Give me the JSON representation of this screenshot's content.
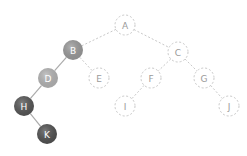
{
  "diagram": {
    "type": "binary-tree",
    "colors": {
      "background": "#ffffff",
      "dashed_stroke": "#c8c8c8",
      "dashed_label": "#9a9a9a",
      "solid_label": "#ffffff",
      "solid_edge": "#aaaaaa"
    },
    "nodes": [
      {
        "id": "A",
        "label": "A",
        "x": 125,
        "y": 25,
        "style": "dashed"
      },
      {
        "id": "B",
        "label": "B",
        "x": 73,
        "y": 50,
        "style": "filled",
        "fill": "#999999"
      },
      {
        "id": "C",
        "label": "C",
        "x": 178,
        "y": 52,
        "style": "dashed"
      },
      {
        "id": "D",
        "label": "D",
        "x": 48,
        "y": 78,
        "style": "filled",
        "fill": "#b3b3b3"
      },
      {
        "id": "E",
        "label": "E",
        "x": 99,
        "y": 78,
        "style": "dashed"
      },
      {
        "id": "F",
        "label": "F",
        "x": 151,
        "y": 78,
        "style": "dashed"
      },
      {
        "id": "G",
        "label": "G",
        "x": 204,
        "y": 78,
        "style": "dashed"
      },
      {
        "id": "H",
        "label": "H",
        "x": 24,
        "y": 106,
        "style": "filled",
        "fill": "#555555"
      },
      {
        "id": "I",
        "label": "I",
        "x": 125,
        "y": 106,
        "style": "dashed"
      },
      {
        "id": "J",
        "label": "J",
        "x": 229,
        "y": 106,
        "style": "dashed"
      },
      {
        "id": "K",
        "label": "K",
        "x": 47,
        "y": 134,
        "style": "filled",
        "fill": "#505050"
      }
    ],
    "edges": [
      {
        "from": "A",
        "to": "B",
        "style": "dashed"
      },
      {
        "from": "A",
        "to": "C",
        "style": "dashed"
      },
      {
        "from": "B",
        "to": "D",
        "style": "solid"
      },
      {
        "from": "B",
        "to": "E",
        "style": "dashed"
      },
      {
        "from": "C",
        "to": "F",
        "style": "dashed"
      },
      {
        "from": "C",
        "to": "G",
        "style": "dashed"
      },
      {
        "from": "D",
        "to": "H",
        "style": "solid"
      },
      {
        "from": "F",
        "to": "I",
        "style": "dashed"
      },
      {
        "from": "G",
        "to": "J",
        "style": "dashed"
      },
      {
        "from": "H",
        "to": "K",
        "style": "solid"
      }
    ],
    "node_radius": 10
  }
}
